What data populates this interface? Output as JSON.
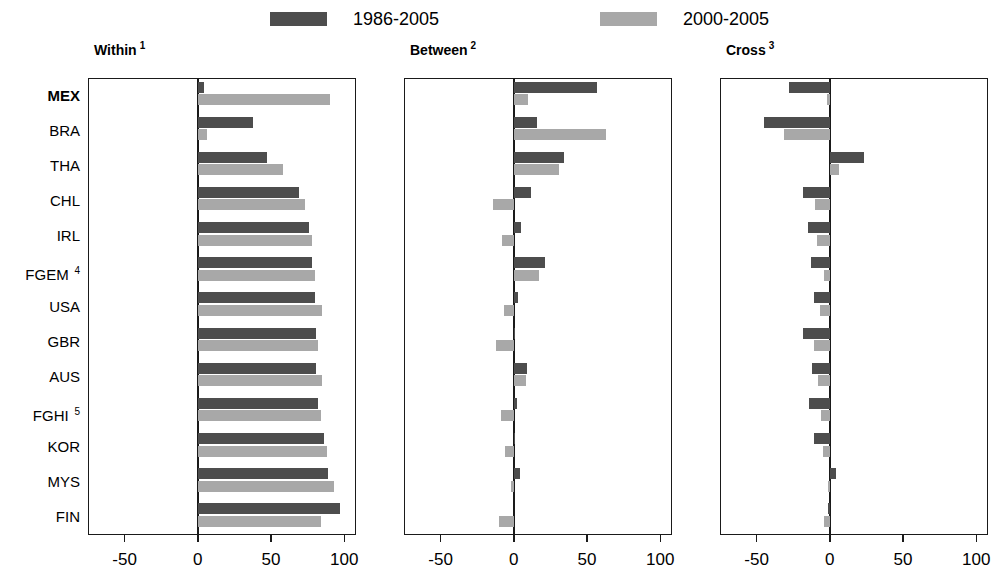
{
  "legend": {
    "items": [
      {
        "label": "1986-2005",
        "color": "#4d4d4d",
        "key": "p1"
      },
      {
        "label": "2000-2005",
        "color": "#a8a8a8",
        "key": "p2"
      }
    ]
  },
  "panels": [
    {
      "title": "Within",
      "footnote": "1"
    },
    {
      "title": "Between",
      "footnote": "2"
    },
    {
      "title": "Cross",
      "footnote": "3"
    }
  ],
  "countries": [
    {
      "code": "MEX",
      "footnote": "",
      "bold": true
    },
    {
      "code": "BRA",
      "footnote": "",
      "bold": false
    },
    {
      "code": "THA",
      "footnote": "",
      "bold": false
    },
    {
      "code": "CHL",
      "footnote": "",
      "bold": false
    },
    {
      "code": "IRL",
      "footnote": "",
      "bold": false
    },
    {
      "code": "FGEM",
      "footnote": "4",
      "bold": false
    },
    {
      "code": "USA",
      "footnote": "",
      "bold": false
    },
    {
      "code": "GBR",
      "footnote": "",
      "bold": false
    },
    {
      "code": "AUS",
      "footnote": "",
      "bold": false
    },
    {
      "code": "FGHI",
      "footnote": "5",
      "bold": false
    },
    {
      "code": "KOR",
      "footnote": "",
      "bold": false
    },
    {
      "code": "MYS",
      "footnote": "",
      "bold": false
    },
    {
      "code": "FIN",
      "footnote": "",
      "bold": false
    }
  ],
  "axis": {
    "min": -75,
    "max": 108,
    "ticks": [
      -50,
      0,
      50,
      100
    ],
    "ticklabels": [
      "-50",
      "0",
      "50",
      "100"
    ]
  },
  "chart_data": {
    "type": "bar",
    "title": "",
    "orientation": "horizontal",
    "panels": [
      "Within",
      "Between",
      "Cross"
    ],
    "categories": [
      "MEX",
      "BRA",
      "THA",
      "CHL",
      "IRL",
      "FGEM",
      "USA",
      "GBR",
      "AUS",
      "FGHI",
      "KOR",
      "MYS",
      "FIN"
    ],
    "xlabel": "",
    "ylabel": "",
    "xlim": [
      -75,
      108
    ],
    "grid": false,
    "legend_position": "top",
    "series": [
      {
        "name": "1986-2005",
        "color": "#4d4d4d"
      },
      {
        "name": "2000-2005",
        "color": "#a8a8a8"
      }
    ],
    "values": {
      "Within": {
        "1986-2005": [
          4,
          38,
          47,
          69,
          76,
          78,
          80,
          81,
          81,
          82,
          86,
          89,
          97
        ],
        "2000-2005": [
          90,
          6,
          58,
          73,
          78,
          80,
          85,
          82,
          85,
          84,
          88,
          93,
          84
        ]
      },
      "Between": {
        "1986-2005": [
          57,
          16,
          34,
          12,
          5,
          21,
          3,
          1,
          9,
          2,
          1,
          4,
          0
        ],
        "2000-2005": [
          10,
          63,
          31,
          -14,
          -8,
          17,
          -7,
          -12,
          8,
          -9,
          -6,
          -2,
          -10
        ]
      },
      "Cross": {
        "1986-2005": [
          -28,
          -45,
          23,
          -18,
          -15,
          -13,
          -11,
          -18,
          -12,
          -14,
          -11,
          4,
          -1
        ],
        "2000-2005": [
          -2,
          -31,
          6,
          -10,
          -9,
          -4,
          -7,
          -11,
          -8,
          -6,
          -5,
          -1,
          -4
        ]
      }
    }
  }
}
